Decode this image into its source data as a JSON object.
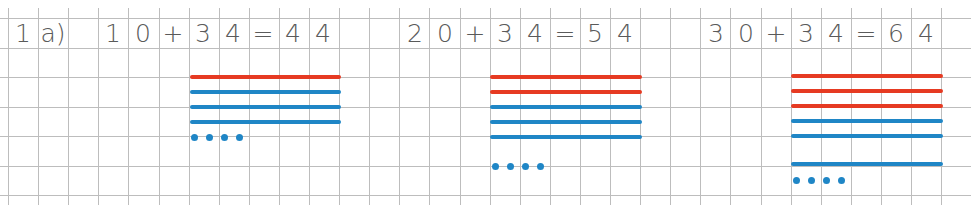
{
  "exercise": {
    "label_number": "1",
    "label_part": "a)",
    "colors": {
      "tens": "#e63a22",
      "ones": "#1f86c6",
      "text": "#5a5a5a",
      "grid": "#bdbdbd"
    },
    "equations": [
      {
        "a": [
          "1",
          "0"
        ],
        "op": "+",
        "b": [
          "3",
          "4"
        ],
        "eq": "=",
        "result": [
          "4",
          "4"
        ]
      },
      {
        "a": [
          "2",
          "0"
        ],
        "op": "+",
        "b": [
          "3",
          "4"
        ],
        "eq": "=",
        "result": [
          "5",
          "4"
        ]
      },
      {
        "a": [
          "3",
          "0"
        ],
        "op": "+",
        "b": [
          "3",
          "4"
        ],
        "eq": "=",
        "result": [
          "6",
          "4"
        ]
      }
    ],
    "models": [
      {
        "red_tens": 1,
        "blue_tens": 3,
        "ones_dots": 4
      },
      {
        "red_tens": 2,
        "blue_tens": 3,
        "ones_dots": 4
      },
      {
        "red_tens": 3,
        "blue_tens": 3,
        "ones_dots": 4
      }
    ]
  }
}
